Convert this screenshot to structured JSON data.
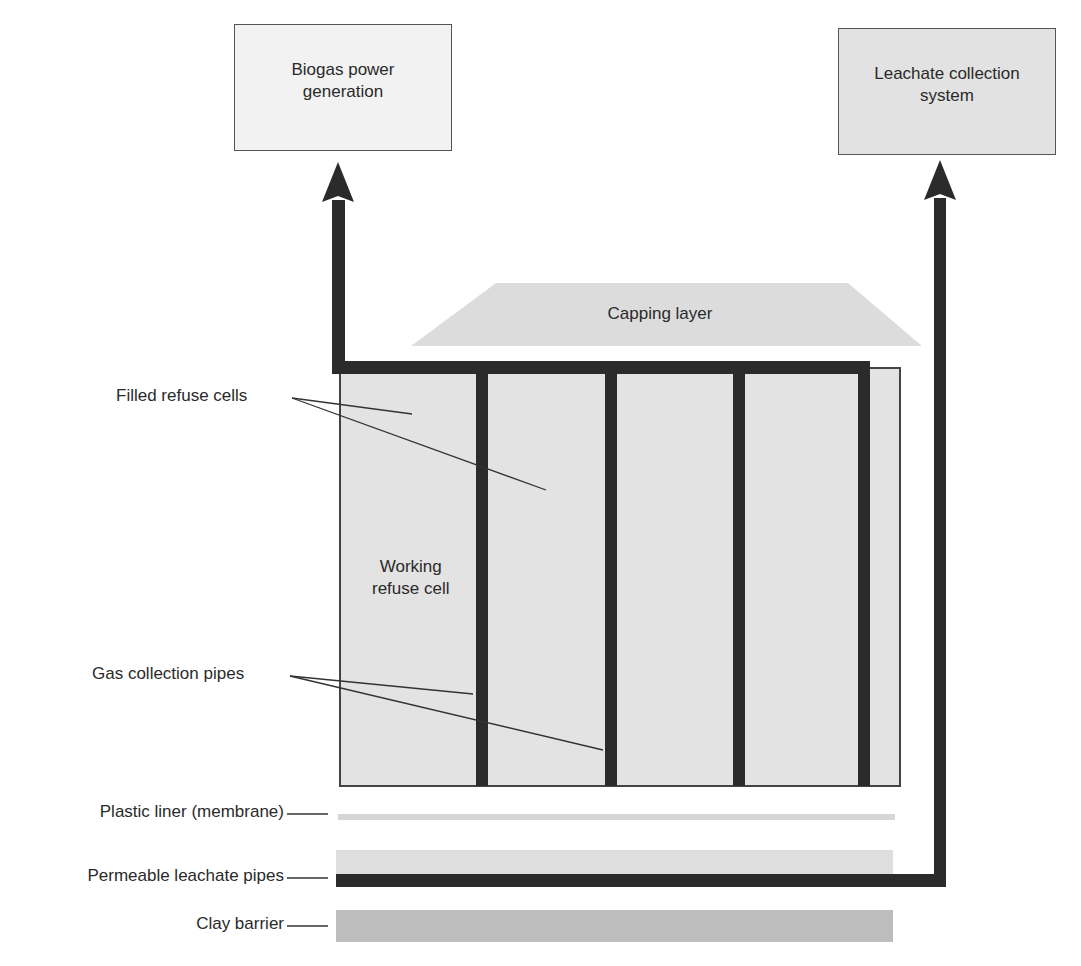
{
  "diagram": {
    "colors": {
      "cell_fill": "#e3e3e3",
      "cap_fill": "#dcdcdc",
      "pipe": "#2b2b2b",
      "liner": "#d6d6d6",
      "drainage_layer": "#dedede",
      "clay": "#bdbdbd",
      "box_biogas": "#f2f2f2",
      "box_leachate": "#e2e2e2"
    },
    "boxes": {
      "biogas": "Biogas power generation",
      "biogas_line1": "Biogas power",
      "biogas_line2": "generation",
      "leachate": "Leachate collection system",
      "leachate_line1": "Leachate collection",
      "leachate_line2": "system"
    },
    "capping_layer": "Capping layer",
    "labels": {
      "filled_cells": "Filled refuse cells",
      "working_cell_line1": "Working",
      "working_cell_line2": "refuse cell",
      "gas_pipes": "Gas collection pipes",
      "plastic_liner": "Plastic liner (membrane)",
      "leachate_pipes": "Permeable leachate pipes",
      "clay_barrier": "Clay barrier"
    },
    "flows": [
      {
        "from": "Gas collection pipes",
        "to": "Biogas power generation"
      },
      {
        "from": "Permeable leachate pipes",
        "to": "Leachate collection system"
      }
    ]
  }
}
